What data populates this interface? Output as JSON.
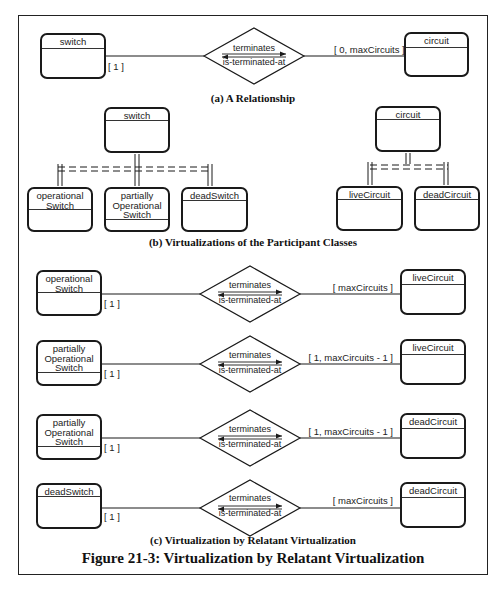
{
  "figure": {
    "title": "Figure 21-3: Virtualization by Relatant Virtualization",
    "colors": {
      "line": "#1a1a1a",
      "background": "#ffffff",
      "text": "#222222"
    }
  },
  "section_a": {
    "caption": "(a) A Relationship",
    "left_class": "switch",
    "right_class": "circuit",
    "relationship": {
      "forward": "terminates",
      "reverse": "is-terminated-at"
    },
    "left_multiplicity": "[ 1 ]",
    "right_multiplicity": "[ 0, maxCircuits ]"
  },
  "section_b": {
    "caption": "(b) Virtualizations of the Participant Classes",
    "switch_parent": "switch",
    "switch_children": [
      "operational\nSwitch",
      "partially\nOperational\nSwitch",
      "deadSwitch"
    ],
    "circuit_parent": "circuit",
    "circuit_children": [
      "liveCircuit",
      "deadCircuit"
    ]
  },
  "section_c": {
    "caption": "(c) Virtualization by Relatant Virtualization",
    "rows": [
      {
        "left_class": "operational\nSwitch",
        "right_class": "liveCircuit",
        "forward": "terminates",
        "reverse": "is-terminated-at",
        "left_multiplicity": "[ 1 ]",
        "right_multiplicity": "[ maxCircuits ]"
      },
      {
        "left_class": "partially\nOperational\nSwitch",
        "right_class": "liveCircuit",
        "forward": "terminates",
        "reverse": "is-terminated-at",
        "left_multiplicity": "[ 1 ]",
        "right_multiplicity": "[ 1, maxCircuits - 1 ]"
      },
      {
        "left_class": "partially\nOperational\nSwitch",
        "right_class": "deadCircuit",
        "forward": "terminates",
        "reverse": "is-terminated-at",
        "left_multiplicity": "[ 1 ]",
        "right_multiplicity": "[ 1, maxCircuits - 1 ]"
      },
      {
        "left_class": "deadSwitch",
        "right_class": "deadCircuit",
        "forward": "terminates",
        "reverse": "is-terminated-at",
        "left_multiplicity": "[ 1 ]",
        "right_multiplicity": "[ maxCircuits ]"
      }
    ]
  }
}
